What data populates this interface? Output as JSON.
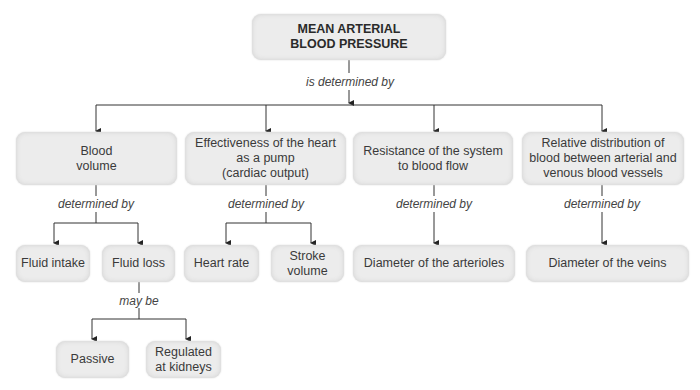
{
  "root": {
    "label": "MEAN ARTERIAL\nBLOOD PRESSURE",
    "relation": "is determined by"
  },
  "factors": [
    {
      "label": "Blood\nvolume",
      "relation": "determined by"
    },
    {
      "label": "Effectiveness of the heart\nas a pump\n(cardiac output)",
      "relation": "determined by"
    },
    {
      "label": "Resistance of the system\nto blood flow",
      "relation": "determined by"
    },
    {
      "label": "Relative distribution of\nblood between arterial and\nvenous blood vessels",
      "relation": "determined by"
    }
  ],
  "determinants": {
    "fluid_intake": "Fluid intake",
    "fluid_loss": "Fluid loss",
    "heart_rate": "Heart rate",
    "stroke_volume": "Stroke\nvolume",
    "arterioles": "Diameter of the arterioles",
    "veins": "Diameter of the veins"
  },
  "fluid_loss_relation": "may be",
  "fluid_loss_types": {
    "passive": "Passive",
    "regulated": "Regulated\nat kidneys"
  }
}
